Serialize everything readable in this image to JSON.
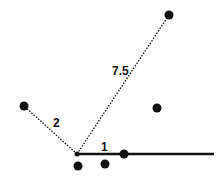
{
  "diagram": {
    "type": "k-nearest-neighbors distance illustration",
    "colors": {
      "point": "#111111",
      "line": "#111111",
      "background": "#ffffff"
    },
    "origin": {
      "x": 77,
      "y": 154
    },
    "reference_line": {
      "x1": 77,
      "y1": 154,
      "x2": 214,
      "y2": 154,
      "style": "solid"
    },
    "points": [
      {
        "id": "p-top",
        "x": 169,
        "y": 15
      },
      {
        "id": "p-left",
        "x": 24,
        "y": 106
      },
      {
        "id": "p-right-mid",
        "x": 157,
        "y": 108
      },
      {
        "id": "p-on-line",
        "x": 124,
        "y": 154
      },
      {
        "id": "p-below-left",
        "x": 78,
        "y": 166
      },
      {
        "id": "p-below-mid",
        "x": 105,
        "y": 164
      }
    ],
    "distances": [
      {
        "to": "p-top",
        "label": "7.5",
        "style": "dotted",
        "label_x": 112,
        "label_y": 75
      },
      {
        "to": "p-left",
        "label": "2",
        "style": "dotted",
        "label_x": 53,
        "label_y": 127
      },
      {
        "to": "p-on-line",
        "label": "1",
        "style": "solid",
        "label_x": 101,
        "label_y": 151
      }
    ]
  }
}
